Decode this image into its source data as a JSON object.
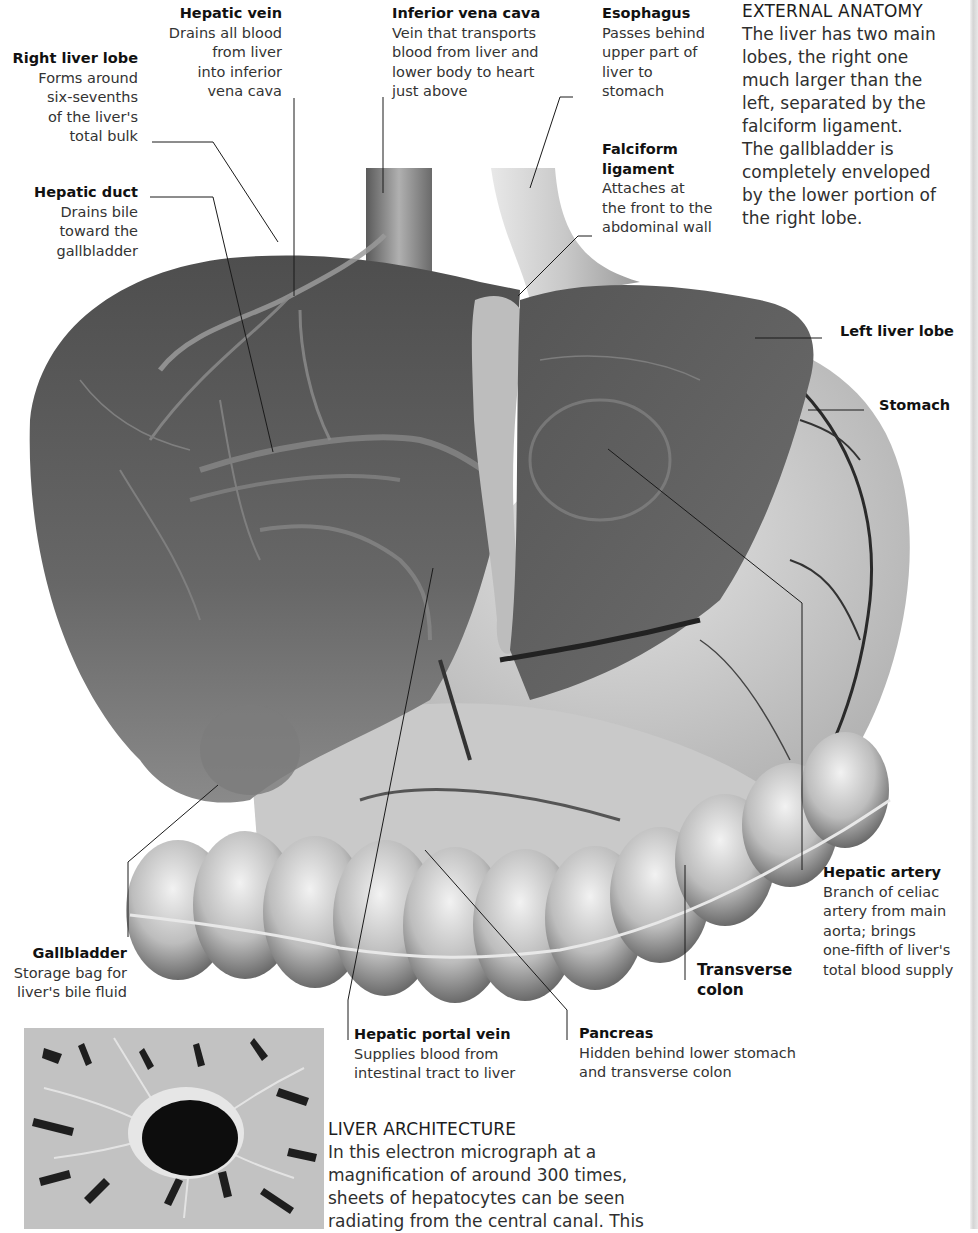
{
  "sections": {
    "external_anatomy": {
      "heading": "EXTERNAL ANATOMY",
      "body": "The liver has two main\nlobes, the right one\nmuch larger than the\nleft, separated by the\nfalciform ligament.\nThe gallbladder is\ncompletely enveloped\nby the lower portion of\nthe right lobe."
    },
    "liver_architecture": {
      "heading": "LIVER ARCHITECTURE",
      "body": "In this electron micrograph at a\nmagnification of around 300 times,\nsheets of hepatocytes can be seen\nradiating from the central canal. This"
    }
  },
  "labels": {
    "hepatic_vein": {
      "title": "Hepatic vein",
      "desc": "Drains all blood\nfrom liver\ninto inferior\nvena cava"
    },
    "right_liver_lobe": {
      "title": "Right liver lobe",
      "desc": "Forms around\nsix-sevenths\nof the liver's\ntotal bulk"
    },
    "hepatic_duct": {
      "title": "Hepatic duct",
      "desc": "Drains bile\ntoward the\ngallbladder"
    },
    "inferior_vena_cava": {
      "title": "Inferior vena cava",
      "desc": "Vein that transports\nblood from liver and\nlower body to heart\njust above"
    },
    "esophagus": {
      "title": "Esophagus",
      "desc": "Passes behind\nupper part of\nliver to\nstomach"
    },
    "falciform_ligament": {
      "title": "Falciform\nligament",
      "desc": "Attaches at\nthe front to the\nabdominal wall"
    },
    "left_liver_lobe": {
      "title": "Left liver lobe",
      "desc": ""
    },
    "stomach": {
      "title": "Stomach",
      "desc": ""
    },
    "hepatic_artery": {
      "title": "Hepatic artery",
      "desc": "Branch of celiac\nartery from main\naorta; brings\none-fifth of liver's\ntotal blood supply"
    },
    "transverse_colon": {
      "title": "Transverse\ncolon",
      "desc": ""
    },
    "gallbladder": {
      "title": "Gallbladder",
      "desc": "Storage bag for\nliver's bile fluid"
    },
    "hepatic_portal_vein": {
      "title": "Hepatic portal vein",
      "desc": "Supplies blood from\nintestinal tract to liver"
    },
    "pancreas": {
      "title": "Pancreas",
      "desc": "Hidden behind lower stomach\nand transverse colon"
    }
  },
  "images": {
    "main_illustration": "liver-anatomy-illustration",
    "micrograph": "liver-electron-micrograph"
  }
}
